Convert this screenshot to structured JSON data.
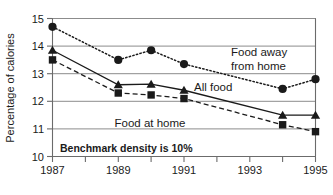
{
  "chart_data": {
    "type": "line",
    "title": "",
    "xlabel": "",
    "ylabel": "Percentage of calories",
    "xlim": [
      1987,
      1995
    ],
    "ylim": [
      10,
      15
    ],
    "grid": true,
    "legend_position": "inline-annotations",
    "x_ticks": [
      1987,
      1988,
      1989,
      1990,
      1991,
      1992,
      1993,
      1994,
      1995
    ],
    "x_tick_labels": [
      "1987",
      "",
      "1989",
      "",
      "1991",
      "",
      "1993",
      "",
      "1995"
    ],
    "y_ticks": [
      10,
      11,
      12,
      13,
      14,
      15
    ],
    "y_tick_labels": [
      "10",
      "11",
      "12",
      "13",
      "14",
      "15"
    ],
    "x": [
      1987,
      1989,
      1990,
      1991,
      1994,
      1995
    ],
    "series": [
      {
        "name": "Food away from home",
        "marker": "circle",
        "line_style": "dotted",
        "values": [
          14.7,
          13.5,
          13.85,
          13.35,
          12.45,
          12.8
        ]
      },
      {
        "name": "All food",
        "marker": "triangle",
        "line_style": "solid",
        "values": [
          13.85,
          12.6,
          12.62,
          12.4,
          11.5,
          11.5
        ]
      },
      {
        "name": "Food at home",
        "marker": "square",
        "line_style": "dashed",
        "values": [
          13.5,
          12.3,
          12.23,
          12.1,
          11.15,
          10.9
        ]
      }
    ],
    "annotations": [
      {
        "name": "food-away-label",
        "text_line1": "Food away",
        "text_line2": "from home"
      },
      {
        "name": "all-food-label",
        "text": "All food"
      },
      {
        "name": "food-at-home-label",
        "text": "Food at home"
      },
      {
        "name": "benchmark-note",
        "text": "Benchmark density is 10%"
      }
    ]
  },
  "axis": {
    "y_title": "Percentage of calories",
    "y_labels": [
      "15",
      "14",
      "13",
      "12",
      "11",
      "10"
    ],
    "x_labels": [
      "1987",
      "1989",
      "1991",
      "1993",
      "1995"
    ]
  },
  "labels": {
    "food_away_line1": "Food away",
    "food_away_line2": "from home",
    "all_food": "All food",
    "food_at_home": "Food at home",
    "benchmark": "Benchmark density is 10%"
  },
  "colors": {
    "ink": "#1a1a1a",
    "grid": "#8c8c8c",
    "axis": "#6b6b6b",
    "background": "#ffffff"
  }
}
